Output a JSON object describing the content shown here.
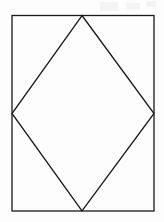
{
  "figure": {
    "canvas": {
      "width": 164,
      "height": 222,
      "background": "#fdfdfd"
    },
    "stroke": {
      "color": "#1a1a1a",
      "width": 1.3,
      "linejoin": "miter"
    },
    "fill": "none",
    "shapes": [
      {
        "name": "outer-rectangle",
        "type": "rect",
        "x": 12,
        "y": 15.5,
        "width": 142,
        "height": 195.5,
        "points": "12,15.5 154,15.5 154,211 12,211"
      },
      {
        "name": "inscribed-rhombus",
        "type": "polygon",
        "points": "82,15.5 154,113.5 82,211 12,113.5",
        "vertices": [
          {
            "label": "top",
            "x": 82,
            "y": 15.5
          },
          {
            "label": "right",
            "x": 154,
            "y": 113.5
          },
          {
            "label": "bottom",
            "x": 82,
            "y": 211
          },
          {
            "label": "left",
            "x": 12,
            "y": 113.5
          }
        ]
      }
    ],
    "labels": [],
    "annotations": []
  }
}
